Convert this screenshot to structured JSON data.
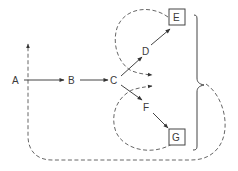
{
  "diagram": {
    "nodes": [
      {
        "id": "A",
        "label": "A"
      },
      {
        "id": "B",
        "label": "B"
      },
      {
        "id": "C",
        "label": "C"
      },
      {
        "id": "D",
        "label": "D"
      },
      {
        "id": "E",
        "label": "E",
        "boxed": true
      },
      {
        "id": "F",
        "label": "F"
      },
      {
        "id": "G",
        "label": "G",
        "boxed": true
      }
    ],
    "edges": [
      {
        "from": "A",
        "to": "B",
        "style": "solid"
      },
      {
        "from": "B",
        "to": "C",
        "style": "solid"
      },
      {
        "from": "C",
        "to": "D",
        "style": "solid"
      },
      {
        "from": "D",
        "to": "E",
        "style": "solid"
      },
      {
        "from": "C",
        "to": "F",
        "style": "solid"
      },
      {
        "from": "F",
        "to": "G",
        "style": "solid"
      },
      {
        "from": "E",
        "to": "C",
        "style": "dashed",
        "note": "feedback loop around upper branch"
      },
      {
        "from": "G",
        "to": "C",
        "style": "dashed",
        "note": "feedback loop around lower branch"
      },
      {
        "from": "brace(E,G)",
        "to": "A",
        "style": "dashed",
        "note": "outer feedback loop to start"
      }
    ],
    "brace": {
      "groups": [
        "E",
        "G"
      ],
      "side": "right"
    }
  }
}
